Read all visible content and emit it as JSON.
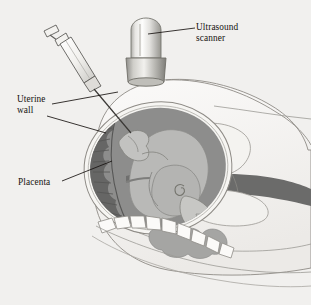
{
  "figure": {
    "kind": "medical-illustration",
    "background_color": "#f1f0ee",
    "ink_color": "#16120f"
  },
  "labels": [
    {
      "id": "ultrasound",
      "name": "ultrasound-scanner-label",
      "line1": "Ultrasound",
      "line2": "scanner",
      "leader": "horizontal line from scanner body to text"
    },
    {
      "id": "uterine",
      "name": "uterine-wall-label",
      "line1": "Uterine",
      "line2": "wall",
      "leader": "two lines to uterine wall and abdominal skin"
    },
    {
      "id": "placenta",
      "name": "placenta-label",
      "line1": "Placenta",
      "line2": "",
      "leader": "line rising to the placental crescent"
    }
  ],
  "anatomy": {
    "skin_fill": "#f7f6f4",
    "skin_stroke": "#8e8b86",
    "uterine_cavity_fill": "#8d8d8c",
    "uterine_wall_band_fill": "#6b6b6a",
    "placenta_fill": "#666665",
    "fetus_fill": "#b9b9b7",
    "bowel_fill": "#a5a5a3",
    "spine_fill": "#fbfaf8",
    "parts": [
      "abdominal-skin-outline",
      "uterus-outer-wall",
      "uterine-cavity",
      "placenta",
      "fetus",
      "umbilical-cord",
      "maternal-bowel",
      "maternal-spine",
      "maternal-back-contour"
    ]
  },
  "instruments": {
    "scanner": {
      "name": "ultrasound-scanner",
      "body_fill_light": "#fdfdfc",
      "body_fill_mid": "#d6d5d2",
      "body_fill_dark": "#9b9a96",
      "collar_fill_dark": "#8b8a86"
    },
    "syringe": {
      "name": "amniocentesis-syringe",
      "barrel_fill": "#fbfaf8",
      "stroke": "#5e5c59",
      "needle_stroke": "#3a3835",
      "parts": [
        "plunger-cap",
        "plunger-rod",
        "barrel",
        "hub",
        "needle"
      ]
    }
  }
}
